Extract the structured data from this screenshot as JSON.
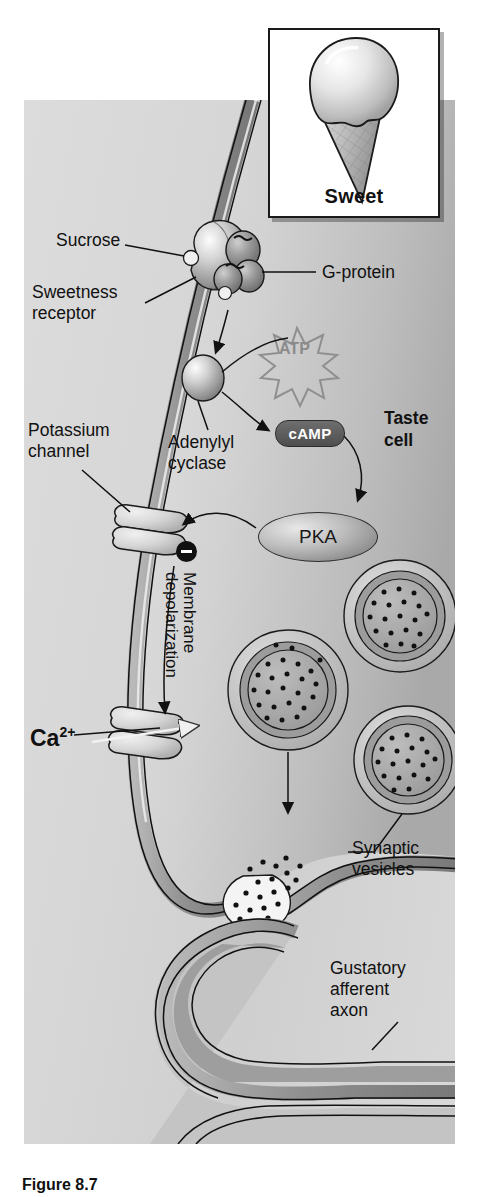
{
  "figure": {
    "caption": "Figure 8.7",
    "domain_subject": "Sweet taste transduction in a taste receptor cell"
  },
  "inset": {
    "label": "Sweet",
    "icon": "ice-cream-cone-icon"
  },
  "labels": {
    "sucrose": "Sucrose",
    "sweetness_receptor_line1": "Sweetness",
    "sweetness_receptor_line2": "receptor",
    "g_protein": "G-protein",
    "adenylyl_line1": "Adenylyl",
    "adenylyl_line2": "cyclase",
    "potassium_line1": "Potassium",
    "potassium_line2": "channel",
    "taste_cell_line1": "Taste",
    "taste_cell_line2": "cell",
    "membrane_depol_line1": "Membrane",
    "membrane_depol_line2": "depolarization",
    "calcium": "Ca2+",
    "calcium_superscript": "2+",
    "calcium_base": "Ca",
    "synaptic_line1": "Synaptic",
    "synaptic_line2": "vesicles",
    "gustatory_line1": "Gustatory",
    "gustatory_line2": "afferent",
    "gustatory_line3": "axon"
  },
  "molecules": {
    "atp": "ATP",
    "camp": "cAMP",
    "pka": "PKA",
    "inhibition_sign": "minus"
  },
  "colors": {
    "plate_background": "#d6d6d6",
    "membrane_band": "#9a9a9a",
    "membrane_outline": "#1a1a1a",
    "cytoplasm": "#c9c9c9",
    "vesicle_core": "#a8a8a8",
    "text": "#111111",
    "atp_outline": "#8a8a8a",
    "camp_fill": "#5a5a5a",
    "inset_border": "#1a1a1a"
  },
  "pathway_steps": [
    "Sucrose binds sweetness receptor",
    "G-protein activated",
    "Adenylyl cyclase converts ATP to cAMP",
    "cAMP activates PKA",
    "PKA inhibits potassium channel",
    "Membrane depolarization",
    "Ca2+ influx through voltage-gated channel",
    "Synaptic vesicles fuse and release transmitter",
    "Gustatory afferent axon excited"
  ]
}
